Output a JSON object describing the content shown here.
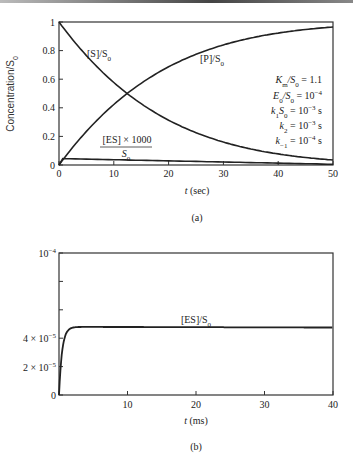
{
  "chart_data": [
    {
      "id": "a",
      "type": "line",
      "caption": "(a)",
      "xlabel": "t (sec)",
      "ylabel": "Concentration/S0",
      "xlim": [
        0,
        50
      ],
      "ylim": [
        0,
        1
      ],
      "xticks": [
        0,
        10,
        20,
        30,
        40,
        50
      ],
      "yticks": [
        0,
        0.2,
        0.4,
        0.6,
        0.8,
        1
      ],
      "ytick_labels": [
        "0",
        "0.2",
        "0.4",
        "0.6",
        "0.8",
        "1"
      ],
      "grid": false,
      "series": [
        {
          "name": "[S]/S0",
          "x": [
            0,
            5,
            10,
            13,
            20,
            30,
            40,
            50
          ],
          "values": [
            1.0,
            0.78,
            0.6,
            0.5,
            0.3,
            0.14,
            0.06,
            0.02
          ]
        },
        {
          "name": "[P]/S0",
          "x": [
            0,
            5,
            10,
            13,
            20,
            30,
            40,
            50
          ],
          "values": [
            0.0,
            0.22,
            0.4,
            0.5,
            0.7,
            0.86,
            0.94,
            0.97
          ]
        },
        {
          "name": "[ES] x 1000 / S0",
          "x": [
            0,
            1,
            10,
            20,
            30,
            40,
            50
          ],
          "values": [
            0.0,
            0.045,
            0.04,
            0.03,
            0.02,
            0.01,
            0.005
          ]
        }
      ],
      "annotations": [
        "Km/S0 = 1.1",
        "E0/S0 = 10^-4",
        "k1S0 = 10^-3 s",
        "k2 = 10^-3 s",
        "k-1 = 10^-4 s"
      ]
    },
    {
      "id": "b",
      "type": "line",
      "caption": "(b)",
      "xlabel": "t (ms)",
      "ylabel": "",
      "xlim": [
        0,
        40
      ],
      "ylim": [
        0,
        0.0001
      ],
      "xticks": [
        0,
        10,
        20,
        30,
        40
      ],
      "yticks": [
        0,
        2e-05,
        4e-05,
        0.0001
      ],
      "ytick_labels": [
        "0",
        "2 × 10⁻⁵",
        "4 × 10⁻⁵",
        "10⁻⁴"
      ],
      "grid": false,
      "series": [
        {
          "name": "[ES]/S0",
          "x": [
            0,
            0.5,
            1,
            1.5,
            2,
            3,
            10,
            20,
            30,
            40
          ],
          "values": [
            0,
            2.5e-05,
            4e-05,
            4.5e-05,
            4.75e-05,
            4.8e-05,
            4.8e-05,
            4.78e-05,
            4.77e-05,
            4.75e-05
          ]
        }
      ]
    }
  ],
  "labels": {
    "a": {
      "s_curve": "[S]/S",
      "p_curve": "[P]/S",
      "es_num": "[ES] × 1000",
      "es_den": "S",
      "sub0": "0",
      "ylabel": "Concentration/S",
      "xlabel_t": "t",
      "xlabel_unit": " (sec)",
      "caption": "(a)",
      "params": [
        {
          "lhs": "K",
          "lhs_sub": "m",
          "rest": "/S",
          "rest_sub": "0",
          "rhs": " = 1.1",
          "exp": ""
        },
        {
          "lhs": "E",
          "lhs_sub": "0",
          "rest": "/S",
          "rest_sub": "0",
          "rhs": " = 10",
          "exp": "−4"
        },
        {
          "lhs": "k",
          "lhs_sub": "1",
          "rest": "S",
          "rest_sub": "0",
          "rhs": " = 10",
          "exp": "−3",
          "unit": " s"
        },
        {
          "lhs": "k",
          "lhs_sub": "2",
          "rest": "",
          "rest_sub": "",
          "rhs": " = 10",
          "exp": "−3",
          "unit": " s"
        },
        {
          "lhs": "k",
          "lhs_sub": "−1",
          "rest": "",
          "rest_sub": "",
          "rhs": " = 10",
          "exp": "−4",
          "unit": " s"
        }
      ]
    },
    "b": {
      "es_curve": "[ES]/S",
      "xlabel_t": "t",
      "xlabel_unit": " (ms)",
      "caption": "(b)"
    }
  }
}
